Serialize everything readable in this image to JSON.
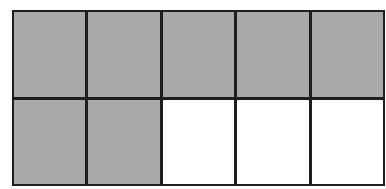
{
  "diagram": {
    "type": "fraction-grid",
    "rows": 2,
    "columns": 5,
    "total_cells": 10,
    "shaded_cells": 7,
    "colors": {
      "shaded": "#a9a9a9",
      "unshaded": "#ffffff",
      "border": "#1e1e1e"
    },
    "cells": [
      {
        "row": 1,
        "col": 1,
        "shaded": true
      },
      {
        "row": 1,
        "col": 2,
        "shaded": true
      },
      {
        "row": 1,
        "col": 3,
        "shaded": true
      },
      {
        "row": 1,
        "col": 4,
        "shaded": true
      },
      {
        "row": 1,
        "col": 5,
        "shaded": true
      },
      {
        "row": 2,
        "col": 1,
        "shaded": true
      },
      {
        "row": 2,
        "col": 2,
        "shaded": true
      },
      {
        "row": 2,
        "col": 3,
        "shaded": false
      },
      {
        "row": 2,
        "col": 4,
        "shaded": false
      },
      {
        "row": 2,
        "col": 5,
        "shaded": false
      }
    ]
  }
}
